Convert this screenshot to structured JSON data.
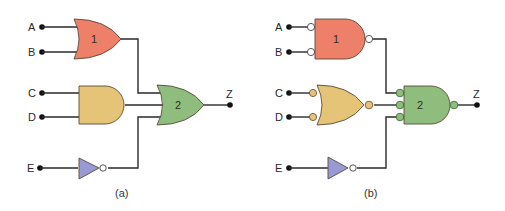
{
  "diagram": {
    "colors": {
      "gate1": "#ee7f68",
      "gate_and_or": "#e6c477",
      "gate2": "#8ebd7e",
      "inverter": "#9999d4",
      "bubble_white": "#ffffff",
      "wire": "#2a2a2a"
    },
    "panels": [
      {
        "id": "a",
        "caption": "(a)",
        "inputs": [
          "A",
          "B",
          "C",
          "D",
          "E"
        ],
        "output": "Z",
        "gates": [
          {
            "label": "1",
            "type": "OR",
            "inputs": [
              "A",
              "B"
            ]
          },
          {
            "label": "",
            "type": "AND",
            "inputs": [
              "C",
              "D"
            ]
          },
          {
            "label": "",
            "type": "NOT",
            "inputs": [
              "E"
            ]
          },
          {
            "label": "2",
            "type": "OR",
            "inputs": [
              "gate1",
              "and",
              "not"
            ]
          }
        ]
      },
      {
        "id": "b",
        "caption": "(b)",
        "inputs": [
          "A",
          "B",
          "C",
          "D",
          "E"
        ],
        "output": "Z",
        "gates": [
          {
            "label": "1",
            "type": "AND with inverted inputs and inverted output",
            "inputs": [
              "A",
              "B"
            ]
          },
          {
            "label": "",
            "type": "OR with inverted inputs and inverted output",
            "inputs": [
              "C",
              "D"
            ]
          },
          {
            "label": "",
            "type": "NOT",
            "inputs": [
              "E"
            ]
          },
          {
            "label": "2",
            "type": "AND with inverted inputs and inverted output",
            "inputs": [
              "gate1",
              "or",
              "not"
            ]
          }
        ]
      }
    ]
  }
}
